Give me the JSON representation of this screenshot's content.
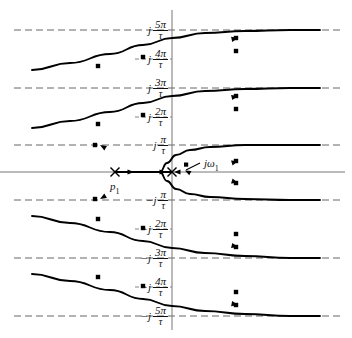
{
  "figure": {
    "kind": "root-locus-plot"
  },
  "axes": {
    "real_axis_name": "real-axis",
    "imag_axis_name": "imaginary-axis"
  },
  "labels": {
    "pole": "p",
    "pole_sub": "1",
    "omega": "jω",
    "omega_sub": "1"
  },
  "ticks": [
    {
      "sign": "j",
      "num": "5π",
      "den": "τ",
      "y": 30,
      "dashed": true
    },
    {
      "sign": "j",
      "num": "4π",
      "den": "τ",
      "y": 59,
      "dashed": false
    },
    {
      "sign": "j",
      "num": "3π",
      "den": "τ",
      "y": 88,
      "dashed": true
    },
    {
      "sign": "j",
      "num": "2π",
      "den": "τ",
      "y": 117,
      "dashed": false
    },
    {
      "sign": "j",
      "num": "π",
      "den": "τ",
      "y": 145,
      "dashed": true
    },
    {
      "sign": "−j",
      "num": "π",
      "den": "τ",
      "y": 200,
      "dashed": true
    },
    {
      "sign": "−j",
      "num": "2π",
      "den": "τ",
      "y": 229,
      "dashed": false
    },
    {
      "sign": "−j",
      "num": "3π",
      "den": "τ",
      "y": 258,
      "dashed": true
    },
    {
      "sign": "−j",
      "num": "4π",
      "den": "τ",
      "y": 287,
      "dashed": false
    },
    {
      "sign": "−j",
      "num": "5π",
      "den": "τ",
      "y": 316,
      "dashed": true
    }
  ],
  "chart_data": {
    "type": "line",
    "title": "",
    "xlabel": "",
    "ylabel": "",
    "xlim": [
      0,
      352
    ],
    "ylim": [
      338,
      0
    ],
    "grid": false,
    "legend": "none",
    "origin_px": {
      "x": 172,
      "y": 172
    },
    "annotations": [
      {
        "text": "p_1",
        "x_px": 117,
        "y_px": 183,
        "marker": "x-cross"
      },
      {
        "text": "jω_1",
        "x_px": 206,
        "y_px": 166,
        "marker": "arrow-to-branch"
      }
    ],
    "real_axis_locus_segment": {
      "from_px": 115,
      "to_px": 172,
      "y_px": 172
    },
    "x_markers_px": [
      {
        "x": 115,
        "y": 172
      },
      {
        "x": 172,
        "y": 172
      }
    ],
    "dot_markers_px": [
      {
        "x": 95,
        "y": 199
      },
      {
        "x": 236,
        "y": 161
      },
      {
        "x": 95,
        "y": 145
      },
      {
        "x": 236,
        "y": 183
      },
      {
        "x": 143,
        "y": 115
      },
      {
        "x": 236,
        "y": 96
      },
      {
        "x": 98,
        "y": 124
      },
      {
        "x": 236,
        "y": 109
      },
      {
        "x": 143,
        "y": 228
      },
      {
        "x": 236,
        "y": 247
      },
      {
        "x": 98,
        "y": 219
      },
      {
        "x": 236,
        "y": 234
      },
      {
        "x": 143,
        "y": 57
      },
      {
        "x": 236,
        "y": 38
      },
      {
        "x": 98,
        "y": 66
      },
      {
        "x": 236,
        "y": 51
      },
      {
        "x": 143,
        "y": 286
      },
      {
        "x": 236,
        "y": 305
      },
      {
        "x": 98,
        "y": 277
      },
      {
        "x": 236,
        "y": 292
      }
    ],
    "series": [
      {
        "name": "branch-upper-5pi",
        "asymptote": "j 5π/τ",
        "points_px": [
          [
            32,
            70
          ],
          [
            70,
            63
          ],
          [
            110,
            54
          ],
          [
            143,
            45
          ],
          [
            172,
            38
          ],
          [
            205,
            33
          ],
          [
            245,
            31
          ],
          [
            290,
            30
          ],
          [
            320,
            30
          ]
        ]
      },
      {
        "name": "branch-upper-3pi",
        "asymptote": "j 3π/τ",
        "points_px": [
          [
            32,
            128
          ],
          [
            70,
            121
          ],
          [
            110,
            112
          ],
          [
            143,
            103
          ],
          [
            172,
            96
          ],
          [
            205,
            91
          ],
          [
            245,
            89
          ],
          [
            290,
            88
          ],
          [
            320,
            88
          ]
        ]
      },
      {
        "name": "branch-center-upper",
        "asymptote": "j π/τ",
        "points_px": [
          [
            160,
            172
          ],
          [
            167,
            163
          ],
          [
            176,
            155
          ],
          [
            190,
            150
          ],
          [
            210,
            147
          ],
          [
            245,
            145
          ],
          [
            290,
            145
          ],
          [
            320,
            145
          ]
        ]
      },
      {
        "name": "branch-center-lower",
        "asymptote": "−j π/τ",
        "points_px": [
          [
            160,
            172
          ],
          [
            167,
            181
          ],
          [
            176,
            189
          ],
          [
            190,
            194
          ],
          [
            210,
            197
          ],
          [
            245,
            199
          ],
          [
            290,
            200
          ],
          [
            320,
            200
          ]
        ]
      },
      {
        "name": "branch-lower-3pi",
        "asymptote": "−j 3π/τ",
        "points_px": [
          [
            32,
            216
          ],
          [
            70,
            223
          ],
          [
            110,
            232
          ],
          [
            143,
            241
          ],
          [
            172,
            248
          ],
          [
            205,
            253
          ],
          [
            245,
            256
          ],
          [
            290,
            258
          ],
          [
            320,
            258
          ]
        ]
      },
      {
        "name": "branch-lower-5pi",
        "asymptote": "−j 5π/τ",
        "points_px": [
          [
            32,
            274
          ],
          [
            70,
            281
          ],
          [
            110,
            290
          ],
          [
            143,
            299
          ],
          [
            172,
            306
          ],
          [
            205,
            311
          ],
          [
            245,
            314
          ],
          [
            290,
            316
          ],
          [
            320,
            316
          ]
        ]
      }
    ]
  }
}
